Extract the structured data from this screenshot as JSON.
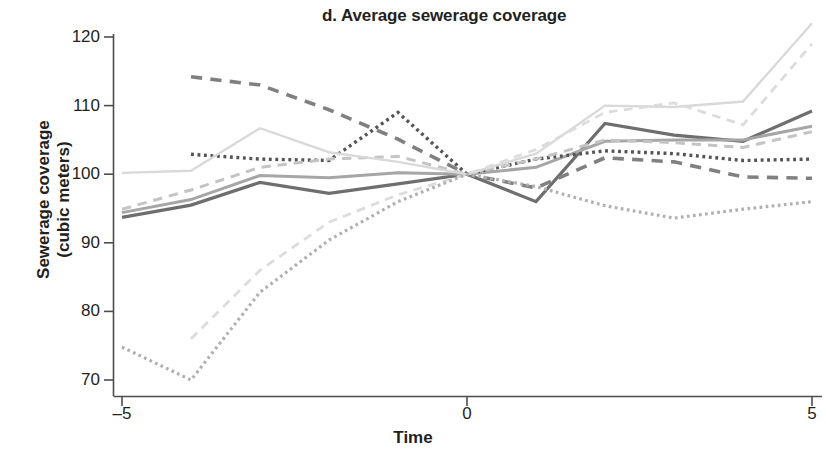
{
  "chart_data": {
    "type": "line",
    "title": "d. Average sewerage coverage",
    "xlabel": "Time",
    "ylabel": "Sewerage coverage\n(cubic meters)",
    "ylabel_line1": "Sewerage coverage",
    "ylabel_line2": "(cubic meters)",
    "xlim": [
      -5,
      5
    ],
    "ylim": [
      67,
      123
    ],
    "grid": false,
    "legend": "none",
    "x": [
      -5,
      -4,
      -3,
      -2,
      -1,
      0,
      1,
      2,
      3,
      4,
      5
    ],
    "xticks": [
      -5,
      0,
      5
    ],
    "xticklabels": [
      "–5",
      "0",
      "5"
    ],
    "yticks": [
      70,
      80,
      90,
      100,
      110,
      120
    ],
    "yticklabels": [
      "70",
      "80",
      "90",
      "100",
      "110",
      "120"
    ],
    "note": "All series are normalized to 100 at Time = 0; eight unlabeled comparison series distinguished only by line weight, shade of gray and dash pattern.",
    "series": [
      {
        "name": "series-1-dark-solid",
        "style": "solid",
        "color": "#6e6e6e",
        "width": 3.2,
        "values": [
          93.7,
          95.5,
          98.8,
          97.2,
          98.6,
          100,
          96.0,
          107.4,
          105.7,
          104.8,
          109.2
        ]
      },
      {
        "name": "series-2-mid-solid",
        "style": "solid",
        "color": "#a6a6a6",
        "width": 3.0,
        "values": [
          94.4,
          96.3,
          99.8,
          99.5,
          100.2,
          100,
          101.0,
          104.8,
          105.0,
          105.0,
          107.0
        ]
      },
      {
        "name": "series-3-dark-dashed",
        "style": "dashed",
        "color": "#808080",
        "width": 3.6,
        "values": [
          null,
          114.2,
          113.0,
          109.4,
          105.1,
          100,
          98.0,
          102.4,
          101.8,
          99.6,
          99.4
        ]
      },
      {
        "name": "series-4-dark-dotted",
        "style": "dotted",
        "color": "#555555",
        "width": 3.4,
        "values": [
          null,
          102.9,
          102.2,
          102.0,
          109.0,
          100,
          102.2,
          103.4,
          103.0,
          102.0,
          102.2
        ]
      },
      {
        "name": "series-5-light-dashed",
        "style": "dashed",
        "color": "#c4c4c4",
        "width": 3.0,
        "values": [
          94.9,
          97.7,
          101.0,
          102.2,
          102.6,
          100,
          102.2,
          105.0,
          104.6,
          103.9,
          106.2
        ]
      },
      {
        "name": "series-6-pale-solid",
        "style": "solid",
        "color": "#d9d9d9",
        "width": 2.4,
        "values": [
          100.2,
          100.5,
          106.7,
          103.2,
          101.8,
          100,
          103.0,
          110.0,
          109.8,
          110.6,
          122.0
        ]
      },
      {
        "name": "series-7-pale-dashed",
        "style": "dashed",
        "color": "#dcdcdc",
        "width": 2.8,
        "values": [
          null,
          76.0,
          86.0,
          93.0,
          97.0,
          100,
          103.6,
          109.0,
          110.4,
          107.2,
          119.0
        ]
      },
      {
        "name": "series-8-mid-dotted",
        "style": "dotted",
        "color": "#b0b0b0",
        "width": 3.2,
        "values": [
          74.8,
          70.0,
          82.8,
          90.4,
          96.0,
          100,
          98.2,
          95.4,
          93.6,
          94.9,
          96.0
        ]
      }
    ]
  },
  "axes": {
    "y_tick_labels": [
      "120",
      "110",
      "100",
      "90",
      "80",
      "70"
    ],
    "x_tick_labels": [
      "–5",
      "0",
      "5"
    ]
  }
}
